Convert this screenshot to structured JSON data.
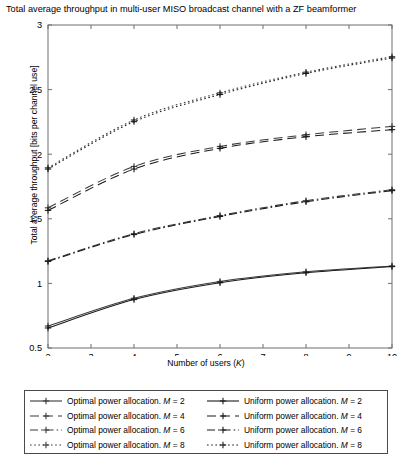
{
  "chart_data": {
    "type": "line",
    "title": "Total average throughput in multi-user MISO broadcast channel with a ZF beamformer",
    "xlabel": "Number of users (K)",
    "ylabel": "Total average throughput [bits per channel use]",
    "xlim": [
      2,
      10
    ],
    "ylim": [
      0.5,
      3
    ],
    "xticks": [
      2,
      3,
      4,
      5,
      6,
      7,
      8,
      9,
      10
    ],
    "yticks": [
      0.5,
      1,
      1.5,
      2,
      2.5,
      3
    ],
    "grid": false,
    "legend_position": "below-axes",
    "marker": "plus",
    "marker_x": [
      2,
      4,
      6,
      8,
      10
    ],
    "x": [
      2,
      4,
      6,
      8,
      10
    ],
    "series": [
      {
        "name": "Optimal power allocation. M = 2",
        "allocation": "Optimal",
        "M": 2,
        "linestyle": "solid",
        "color": "#3a3a3a",
        "values": [
          0.67,
          0.885,
          1.015,
          1.09,
          1.135
        ]
      },
      {
        "name": "Uniform power allocation. M = 2",
        "allocation": "Uniform",
        "M": 2,
        "linestyle": "solid",
        "color": "#1a1a1a",
        "values": [
          0.655,
          0.875,
          1.005,
          1.082,
          1.13
        ]
      },
      {
        "name": "Optimal power allocation. M = 4",
        "allocation": "Optimal",
        "M": 4,
        "linestyle": "dashed",
        "color": "#3a3a3a",
        "values": [
          1.585,
          1.905,
          2.06,
          2.15,
          2.215
        ]
      },
      {
        "name": "Uniform power allocation. M = 4",
        "allocation": "Uniform",
        "M": 4,
        "linestyle": "dashed",
        "color": "#1a1a1a",
        "values": [
          1.565,
          1.885,
          2.045,
          2.135,
          2.19
        ]
      },
      {
        "name": "Optimal power allocation. M = 6",
        "allocation": "Optimal",
        "M": 6,
        "linestyle": "dashdot",
        "color": "#3a3a3a",
        "values": [
          1.175,
          1.385,
          1.525,
          1.64,
          1.725
        ]
      },
      {
        "name": "Uniform power allocation. M = 6",
        "allocation": "Uniform",
        "M": 6,
        "linestyle": "dashdot",
        "color": "#1a1a1a",
        "values": [
          1.17,
          1.378,
          1.518,
          1.632,
          1.718
        ]
      },
      {
        "name": "Optimal power allocation. M = 8",
        "allocation": "Optimal",
        "M": 8,
        "linestyle": "dotted",
        "color": "#3a3a3a",
        "values": [
          1.895,
          2.265,
          2.475,
          2.635,
          2.755
        ]
      },
      {
        "name": "Uniform power allocation. M = 8",
        "allocation": "Uniform",
        "M": 8,
        "linestyle": "dotted",
        "color": "#1a1a1a",
        "values": [
          1.885,
          2.252,
          2.462,
          2.625,
          2.745
        ]
      }
    ]
  },
  "axes": {
    "xtick_labels": [
      "2",
      "3",
      "4",
      "5",
      "6",
      "7",
      "8",
      "9",
      "10"
    ],
    "ytick_labels": [
      "0.5",
      "1",
      "1.5",
      "2",
      "2.5",
      "3"
    ]
  },
  "legend": {
    "rows": [
      {
        "left": "Optimal power allocation. M = 2",
        "right": "Uniform power allocation. M = 2"
      },
      {
        "left": "Optimal power allocation. M = 4",
        "right": "Uniform power allocation. M = 4"
      },
      {
        "left": "Optimal power allocation. M = 6",
        "right": "Uniform power allocation. M = 6"
      },
      {
        "left": "Optimal power allocation. M = 8",
        "right": "Uniform power allocation. M = 8"
      }
    ]
  }
}
